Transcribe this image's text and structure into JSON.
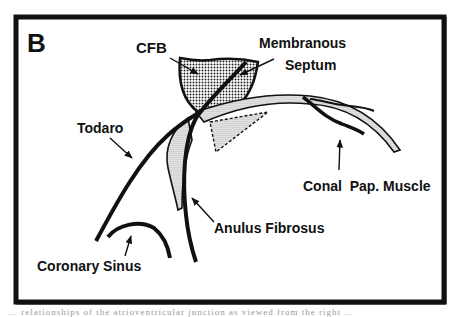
{
  "figure": {
    "panel_label": "B",
    "labels": {
      "cfb": "CFB",
      "membranous_1": "Membranous",
      "membranous_2": "Septum",
      "todaro": "Todaro",
      "conal": "Conal  Pap. Muscle",
      "anulus": "Anulus Fibrosus",
      "coronary": "Coronary Sinus"
    },
    "caption_fragment": "… relationships of the atrioventricular junction as viewed from the right …"
  },
  "colors": {
    "ink": "#111111",
    "stipple_dense": "#8a8a8a",
    "stipple_light": "#c8c8c8",
    "background": "#ffffff"
  }
}
